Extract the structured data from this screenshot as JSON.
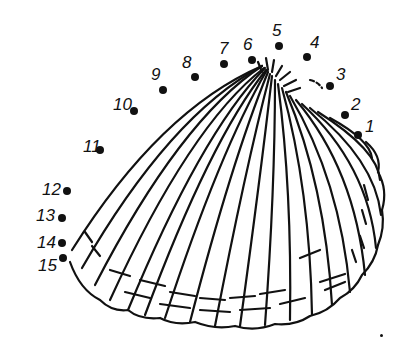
{
  "colors": {
    "ink": "#111111",
    "paper": "#ffffff"
  },
  "dots": [
    {
      "n": "1",
      "x": 358,
      "y": 135,
      "lx": 365,
      "ly": 118
    },
    {
      "n": "2",
      "x": 345,
      "y": 115,
      "lx": 351,
      "ly": 96
    },
    {
      "n": "3",
      "x": 330,
      "y": 86,
      "lx": 336,
      "ly": 66
    },
    {
      "n": "4",
      "x": 307,
      "y": 57,
      "lx": 310,
      "ly": 34
    },
    {
      "n": "5",
      "x": 279,
      "y": 46,
      "lx": 272,
      "ly": 22
    },
    {
      "n": "6",
      "x": 252,
      "y": 60,
      "lx": 243,
      "ly": 36
    },
    {
      "n": "7",
      "x": 224,
      "y": 64,
      "lx": 219,
      "ly": 40
    },
    {
      "n": "8",
      "x": 195,
      "y": 77,
      "lx": 182,
      "ly": 54
    },
    {
      "n": "9",
      "x": 163,
      "y": 90,
      "lx": 151,
      "ly": 66
    },
    {
      "n": "10",
      "x": 134,
      "y": 111,
      "lx": 113,
      "ly": 96
    },
    {
      "n": "11",
      "x": 100,
      "y": 150,
      "lx": 83,
      "ly": 138
    },
    {
      "n": "12",
      "x": 67,
      "y": 191,
      "lx": 42,
      "ly": 181
    },
    {
      "n": "13",
      "x": 62,
      "y": 218,
      "lx": 36,
      "ly": 207
    },
    {
      "n": "14",
      "x": 62,
      "y": 243,
      "lx": 37,
      "ly": 234
    },
    {
      "n": "15",
      "x": 63,
      "y": 258,
      "lx": 38,
      "ly": 257
    }
  ],
  "stray_mark": {
    "x": 382,
    "y": 336
  }
}
